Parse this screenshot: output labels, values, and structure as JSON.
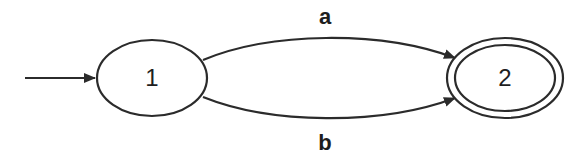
{
  "diagram": {
    "type": "finite-automaton",
    "states": [
      {
        "id": "1",
        "label": "1",
        "initial": true,
        "accepting": false
      },
      {
        "id": "2",
        "label": "2",
        "initial": false,
        "accepting": true
      }
    ],
    "transitions": [
      {
        "from": "1",
        "to": "2",
        "label": "a"
      },
      {
        "from": "1",
        "to": "2",
        "label": "b"
      }
    ],
    "colors": {
      "stroke": "#2b2b2b",
      "background": "#ffffff"
    }
  }
}
